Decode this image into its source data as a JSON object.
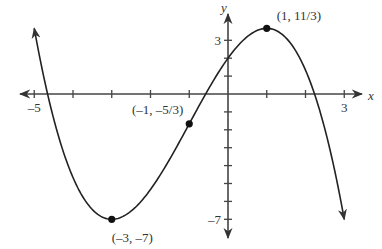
{
  "chart_data": {
    "type": "line",
    "title": "",
    "function": "f(x) = -x^3/3 - x^2 + 3x + 2",
    "xlabel": "x",
    "ylabel": "y",
    "xlim": [
      -5.5,
      3.5
    ],
    "ylim": [
      -8,
      4.2
    ],
    "x_ticks": [
      -5,
      -4,
      -3,
      -2,
      -1,
      0,
      1,
      2,
      3
    ],
    "x_tick_labels": [
      {
        "value": -5,
        "label": "–5"
      },
      {
        "value": 3,
        "label": "3"
      }
    ],
    "y_ticks": [
      -7,
      -6,
      -5,
      -4,
      -3,
      -2,
      -1,
      0,
      1,
      2,
      3
    ],
    "y_tick_labels": [
      {
        "value": 3,
        "label": "3"
      },
      {
        "value": -7,
        "label": "–7"
      }
    ],
    "grid": false,
    "curve_domain": [
      -5.0,
      3.0
    ],
    "points": [
      {
        "x": 1,
        "y": 3.6667,
        "label": "(1, 11/3)",
        "kind": "local maximum"
      },
      {
        "x": -1,
        "y": -1.6667,
        "label": "(–1, –5/3)",
        "kind": "inflection point"
      },
      {
        "x": -3,
        "y": -7,
        "label": "(–3, –7)",
        "kind": "local minimum"
      }
    ],
    "colors": {
      "curve": "#222222",
      "axis": "#444444",
      "point": "#111111"
    }
  }
}
